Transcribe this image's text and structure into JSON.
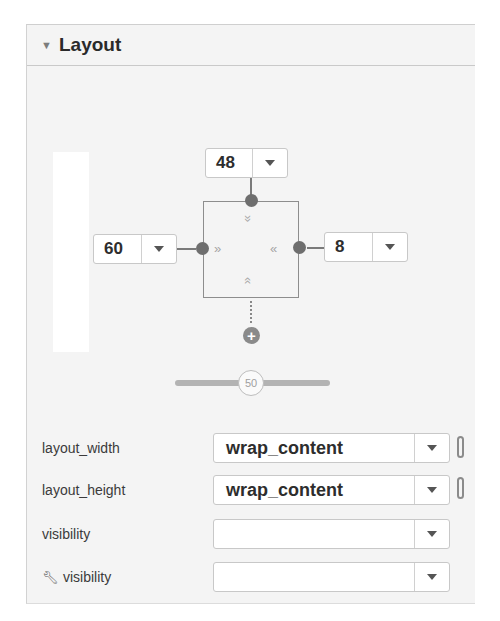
{
  "section": {
    "title": "Layout",
    "expanded": true
  },
  "constraint_widget": {
    "top_margin": "48",
    "left_margin": "60",
    "right_margin": "8",
    "bias_slider_value": "50"
  },
  "properties": [
    {
      "label": "layout_width",
      "value": "wrap_content",
      "has_link": true
    },
    {
      "label": "layout_height",
      "value": "wrap_content",
      "has_link": true
    },
    {
      "label": "visibility",
      "value": "",
      "has_link": false
    },
    {
      "label": "visibility",
      "value": "",
      "has_link": false,
      "icon": "wrench-icon"
    }
  ]
}
